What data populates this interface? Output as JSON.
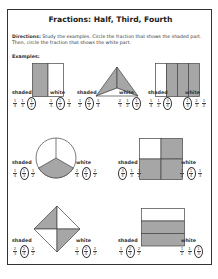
{
  "title": "Fractions: Half, Third, Fourth",
  "directions": {
    "label": "Directions:",
    "text": " Study the examples. Circle the fraction that shows the shaded part. Then, circle the fraction that shows the white part."
  },
  "examples_label": "Examples:",
  "labels": {
    "shaded": "shaded",
    "white": "white"
  },
  "colors": {
    "shaded": "#a6a6a6",
    "outline": "#444444"
  },
  "problems": [
    {
      "shape": "rectangle-halves-vertical",
      "shaded": [
        [
          "1",
          "4"
        ],
        [
          "1",
          "3"
        ],
        [
          "1",
          "2"
        ]
      ],
      "shaded_circled": 2,
      "white": [
        [
          "1",
          "3"
        ],
        [
          "1",
          "2"
        ],
        [
          "1",
          "4"
        ]
      ],
      "white_circled": 1
    },
    {
      "shape": "triangle-thirds",
      "shaded": [
        [
          "1",
          "2"
        ],
        [
          "2",
          "3"
        ],
        [
          "3",
          "4"
        ]
      ],
      "shaded_circled": 1,
      "white": [
        [
          "2",
          "3"
        ],
        [
          "1",
          "2"
        ],
        [
          "1",
          "3"
        ]
      ],
      "white_circled": 2
    },
    {
      "shape": "rectangle-fourths-vertical",
      "shaded": [
        [
          "1",
          "4"
        ],
        [
          "1",
          "2"
        ],
        [
          "3",
          "4"
        ]
      ],
      "shaded_circled": 2,
      "white": [
        [
          "1",
          "4"
        ],
        [
          "2",
          "3"
        ],
        [
          "1",
          "2"
        ]
      ],
      "white_circled": 0
    },
    {
      "shape": "circle-thirds",
      "shaded": [
        [
          "1",
          "4"
        ],
        [
          "1",
          "3"
        ],
        [
          "1",
          "2"
        ]
      ],
      "shaded_circled": 1,
      "white": [
        [
          "2",
          "4"
        ],
        [
          "2",
          "3"
        ],
        [
          "2",
          "2"
        ]
      ],
      "white_circled": 1
    },
    {
      "shape": "square-fourths",
      "shaded": [
        [
          "3",
          "4"
        ],
        [
          "1",
          "3"
        ],
        [
          "3",
          "2"
        ]
      ],
      "shaded_circled": 0,
      "white": [
        [
          "1",
          "2"
        ],
        [
          "1",
          "4"
        ],
        [
          "1",
          "3"
        ]
      ],
      "white_circled": 1
    },
    {
      "shape": "diamond-fourths",
      "shaded": [
        [
          "2",
          "3"
        ],
        [
          "2",
          "4"
        ],
        [
          "2",
          "2"
        ]
      ],
      "shaded_circled": 1,
      "white": [
        [
          "1",
          "3"
        ],
        [
          "2",
          "4"
        ],
        [
          "2",
          "2"
        ]
      ],
      "white_circled": 1
    },
    {
      "shape": "rectangle-thirds-horizontal",
      "shaded": [
        [
          "1",
          "3"
        ],
        [
          "2",
          "3"
        ],
        [
          "2",
          "2"
        ]
      ],
      "shaded_circled": 1,
      "white": [
        [
          "1",
          "2"
        ],
        [
          "1",
          "4"
        ],
        [
          "1",
          "3"
        ]
      ],
      "white_circled": 2
    }
  ]
}
